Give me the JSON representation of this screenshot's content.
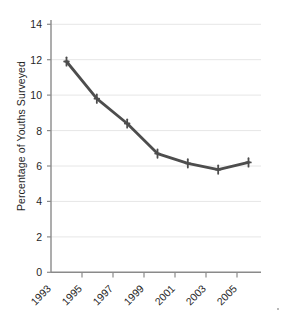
{
  "chart_data": {
    "type": "line",
    "title": "",
    "xlabel": "",
    "ylabel": "Percentage of Youths Surveyed",
    "categories": [
      "1993",
      "1995",
      "1997",
      "1999",
      "2001",
      "2003",
      "2005"
    ],
    "x": [
      1993,
      1995,
      1997,
      1999,
      2001,
      2003,
      2005
    ],
    "values": [
      11.9,
      9.8,
      8.4,
      6.7,
      6.15,
      5.8,
      6.2
    ],
    "series": [
      {
        "name": "Percentage of Youths Surveyed",
        "values": [
          11.9,
          9.8,
          8.4,
          6.7,
          6.15,
          5.8,
          6.2
        ]
      }
    ],
    "ylim": [
      0,
      14
    ],
    "yticks": [
      0,
      2,
      4,
      6,
      8,
      10,
      12,
      14
    ],
    "ytick_labels": [
      "0",
      "2",
      "4",
      "6",
      "8",
      "10",
      "12",
      "14"
    ],
    "xtick_labels": [
      "1993",
      "1995",
      "1997",
      "1999",
      "2001",
      "2003",
      "2005"
    ],
    "grid": "horizontal",
    "legend": "none",
    "marker": "plus",
    "line_color": "#4d4d4d",
    "grid_color": "#e3e3e3",
    "axis_color": "#808080",
    "background_color": "#ffffff"
  }
}
